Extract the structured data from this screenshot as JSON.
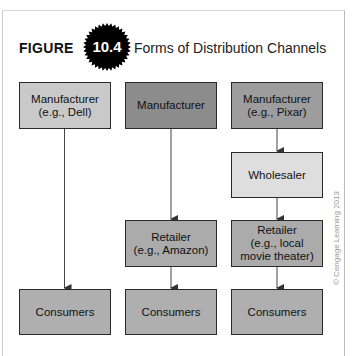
{
  "figure": {
    "label": "FIGURE",
    "number": "10.4",
    "title": "Forms of Distribution Channels"
  },
  "columns": [
    {
      "manufacturer": "Manufacturer\n(e.g., Dell)",
      "consumers": "Consumers"
    },
    {
      "manufacturer": "Manufacturer",
      "retailer": "Retailer\n(e.g., Amazon)",
      "consumers": "Consumers"
    },
    {
      "manufacturer": "Manufacturer\n(e.g., Pixar)",
      "wholesaler": "Wholesaler",
      "retailer": "Retailer\n(e.g., local\nmovie theater)",
      "consumers": "Consumers"
    }
  ],
  "colors": {
    "manufacturer_dell": "#c9c9c9",
    "manufacturer_plain": "#8c8c8c",
    "manufacturer_pixar": "#9d9d9d",
    "wholesaler": "#dedede",
    "retailer": "#ababab",
    "consumers": "#afafaf"
  },
  "copyright": "© Cengage Learning 2013"
}
